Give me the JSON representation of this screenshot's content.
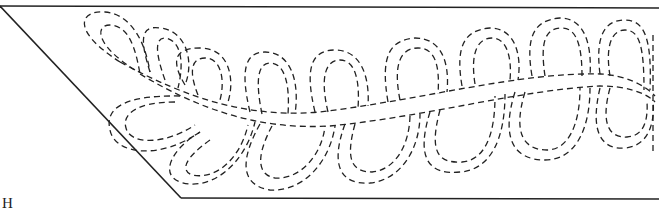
{
  "diagram": {
    "type": "quilting-feather-pattern",
    "border": {
      "shape": "trapezoid",
      "points": [
        [
          0,
          6
        ],
        [
          659,
          8
        ],
        [
          659,
          199
        ],
        [
          181,
          198
        ]
      ],
      "color": "#222222"
    },
    "spine": {
      "style": "double-dashed-curve",
      "upper_path": "M120,62 C190,100 250,118 320,112 C420,100 520,72 600,74 C625,75 645,85 655,96",
      "lower_path": "M140,74 C200,110 260,130 330,126 C430,116 520,90 600,86 C625,86 645,92 655,102"
    },
    "edge_marker": {
      "style": "dashed-vertical",
      "x": 653,
      "y1": 35,
      "y2": 155
    },
    "upper_loops": [
      {
        "outer": "M120,62 C70,30 80,10 105,12 C130,14 145,40 150,72",
        "inner": "M135,70 C95,45 95,25 110,25 C128,26 135,45 140,74"
      },
      {
        "outer": "M150,72 C140,40 140,25 160,28 C185,30 195,60 185,85",
        "inner": "M165,80 C155,52 155,38 165,38 C180,40 185,60 178,88"
      },
      {
        "outer": "M185,85 C170,60 175,48 200,48 C230,48 235,80 228,102",
        "inner": "M198,95 C188,70 192,58 205,58 C222,58 225,82 220,100"
      },
      {
        "outer": "M250,112 C240,70 245,52 265,52 C290,52 300,80 295,114",
        "inner": "M262,114 C255,80 258,63 270,63 C285,63 290,85 288,114"
      },
      {
        "outer": "M315,112 C305,70 310,50 335,50 C360,50 370,75 368,106",
        "inner": "M328,112 C320,78 325,60 340,60 C355,60 360,80 358,108"
      },
      {
        "outer": "M388,102 C380,55 390,40 415,38 C440,38 450,60 447,92",
        "inner": "M400,100 C393,65 400,48 418,48 C435,48 440,65 438,94"
      },
      {
        "outer": "M462,86 C455,45 465,30 490,28 C515,28 522,55 518,80",
        "inner": "M475,84 C470,52 478,38 492,38 C507,38 512,58 510,80"
      },
      {
        "outer": "M532,76 C525,35 535,20 560,18 C585,18 592,45 590,76",
        "inner": "M545,76 C540,42 545,28 562,28 C578,28 582,50 582,76"
      },
      {
        "outer": "M600,74 C595,35 605,20 625,20 C645,20 652,40 650,90",
        "inner": "M610,76 C605,45 612,30 625,30 C640,30 644,48 644,90"
      }
    ],
    "lower_loops": [
      {
        "outer": "M180,96 C120,95 105,110 110,130 C115,155 160,160 200,132",
        "inner": "M175,102 C135,102 122,115 126,128 C130,145 165,145 195,125"
      },
      {
        "outer": "M200,132 C170,150 160,175 180,182 C210,192 245,165 255,122",
        "inner": "M210,140 C185,158 180,170 192,175 C215,180 240,160 248,125"
      },
      {
        "outer": "M260,124 C240,160 240,185 270,190 C305,192 330,160 335,126",
        "inner": "M272,126 C255,158 258,175 275,178 C300,180 322,155 325,126"
      },
      {
        "outer": "M345,124 C330,165 340,185 370,183 C400,180 420,150 420,114",
        "inner": "M355,124 C345,160 352,172 372,172 C395,170 410,145 410,114"
      },
      {
        "outer": "M430,112 C415,160 430,175 460,172 C490,170 505,140 505,94",
        "inner": "M440,110 C428,155 440,163 462,162 C485,160 495,135 495,96"
      },
      {
        "outer": "M515,92 C500,140 515,160 545,160 C575,160 590,130 590,88",
        "inner": "M525,92 C512,135 525,150 547,150 C568,150 580,125 580,88"
      },
      {
        "outer": "M600,88 C590,130 600,150 625,148 C650,146 655,120 653,100",
        "inner": "M610,88 C600,125 610,138 627,137 C645,136 648,118 647,102"
      }
    ],
    "caption_fragment": "H"
  }
}
